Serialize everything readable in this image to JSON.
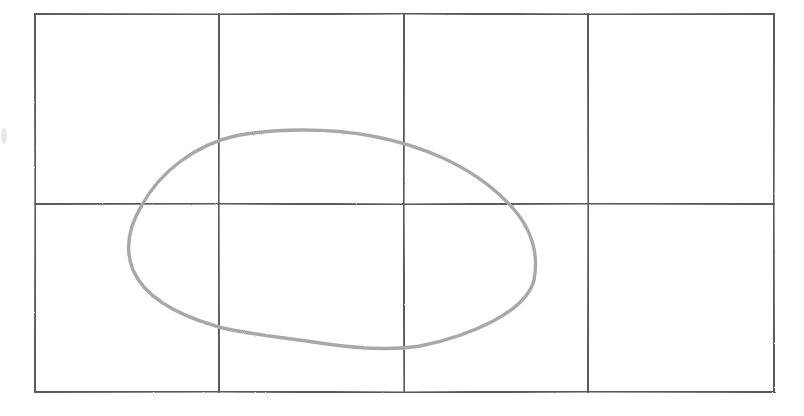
{
  "sketch": {
    "style": "pencil",
    "colors": {
      "background": "#ffffff",
      "grid_stroke": "#5a5a5a",
      "shape_stroke": "#a8a8a8"
    },
    "grid": {
      "columns": 4,
      "rows": 2,
      "left": 35,
      "top": 14,
      "right": 774,
      "bottom": 392,
      "vertical_lines_x": [
        35,
        219,
        404,
        588,
        774
      ],
      "horizontal_lines_y": [
        14,
        204,
        392
      ]
    },
    "shape": {
      "type": "closed-blob",
      "leftmost": [
        128,
        245
      ],
      "top": [
        305,
        131
      ],
      "rightmost": [
        536,
        262
      ],
      "bottom": [
        404,
        348
      ]
    }
  }
}
